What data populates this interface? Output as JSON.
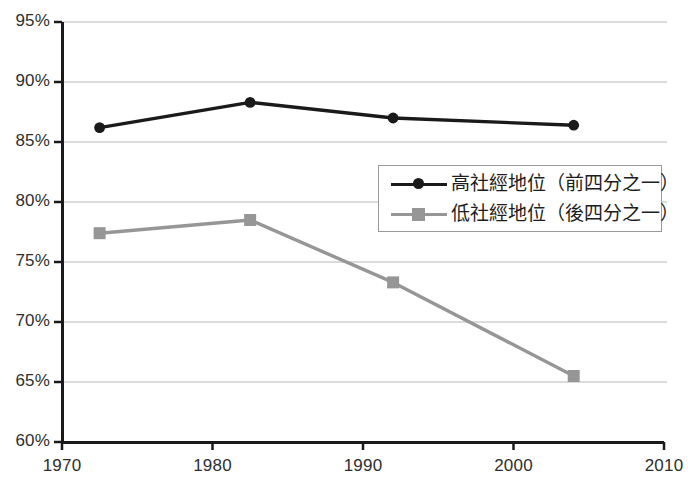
{
  "chart_data": {
    "type": "line",
    "title": "",
    "subtitle": "",
    "xlabel": "",
    "ylabel": "",
    "xlim": [
      1970,
      2010
    ],
    "ylim": [
      60,
      95
    ],
    "grid": "horizontal",
    "legend_position": "center-right",
    "x_ticks": [
      "1970",
      "1980",
      "1990",
      "2000",
      "2010"
    ],
    "x_tick_values": [
      1970,
      1980,
      1990,
      2000,
      2010
    ],
    "y_ticks": [
      "60%",
      "65%",
      "70%",
      "75%",
      "80%",
      "85%",
      "90%",
      "95%"
    ],
    "y_tick_values": [
      60,
      65,
      70,
      75,
      80,
      85,
      90,
      95
    ],
    "x": [
      1972.5,
      1982.5,
      1992,
      2004
    ],
    "series": [
      {
        "name": "高社經地位（前四分之一）",
        "color": "#1a1a1a",
        "marker": "circle",
        "values": [
          86.2,
          88.3,
          87.0,
          86.4
        ]
      },
      {
        "name": "低社經地位（後四分之一）",
        "color": "#969696",
        "marker": "square",
        "values": [
          77.4,
          78.5,
          73.3,
          65.5
        ]
      }
    ]
  },
  "colors": {
    "axis": "#1a1a1a",
    "grid": "#b8b8b8",
    "background": "#ffffff",
    "tick_text": "#2e2e2e",
    "legend_border": "#9a9a9a",
    "series_high": "#1a1a1a",
    "series_low": "#969696"
  }
}
